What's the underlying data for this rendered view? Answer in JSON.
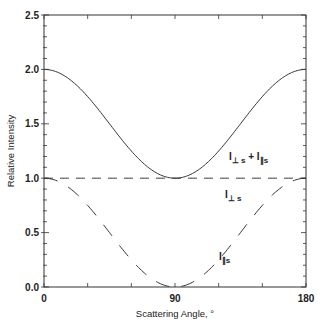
{
  "chart_data": {
    "type": "line",
    "title": "",
    "xlabel": "Scattering Angle, °",
    "ylabel": "Relative Intensity",
    "xlim": [
      0,
      180
    ],
    "ylim": [
      0,
      2.5
    ],
    "xticks": [
      0,
      90,
      180
    ],
    "xtick_labels": [
      "0",
      "90",
      "180"
    ],
    "yticks": [
      0.0,
      0.5,
      1.0,
      1.5,
      2.0,
      2.5
    ],
    "ytick_labels": [
      "0.0",
      "0.5",
      "1.0",
      "1.5",
      "2.0",
      "2.5"
    ],
    "grid": false,
    "legend": "none (inline annotations)",
    "series": [
      {
        "name": "I⊥s + I∥s",
        "style": "solid",
        "x": [
          0,
          30,
          60,
          90,
          120,
          150,
          180
        ],
        "values": [
          2.0,
          1.75,
          1.25,
          1.0,
          1.25,
          1.75,
          2.0
        ]
      },
      {
        "name": "I⊥s",
        "style": "dashed",
        "x": [
          0,
          30,
          60,
          90,
          120,
          150,
          180
        ],
        "values": [
          1.0,
          1.0,
          1.0,
          1.0,
          1.0,
          1.0,
          1.0
        ]
      },
      {
        "name": "I∥s",
        "style": "long-dashed",
        "x": [
          0,
          30,
          60,
          90,
          120,
          150,
          180
        ],
        "values": [
          1.0,
          0.75,
          0.25,
          0.0,
          0.25,
          0.75,
          1.0
        ]
      }
    ],
    "annotations": [
      {
        "text": "I⊥s + I∥s",
        "near": [
          130,
          1.2
        ]
      },
      {
        "text": "I⊥s",
        "near": [
          130,
          0.87
        ]
      },
      {
        "text": "I∥s",
        "near": [
          120,
          0.36
        ]
      }
    ]
  }
}
